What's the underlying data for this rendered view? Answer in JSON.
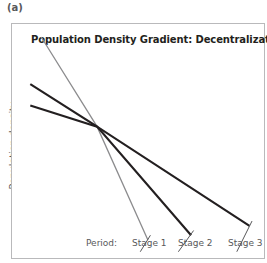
{
  "panel": {
    "letter": "(a)"
  },
  "chart_data": {
    "type": "line",
    "title": "Population Density Gradient: Decentralization",
    "xlabel": "",
    "ylabel": "Population density",
    "x_prefix_label": "Period:",
    "categories": [
      "Stage 1",
      "Stage 2",
      "Stage 3"
    ],
    "grid": false,
    "legend": "none",
    "axis_ticks": "none",
    "xlim": [
      0,
      1
    ],
    "ylim": [
      0,
      1
    ],
    "annotation": "All three density gradients pivot about a common crossover point; successive stages become progressively flatter, indicating decentralization of population away from the centre.",
    "pivot_point": {
      "x": 0.335,
      "y": 0.565
    },
    "series": [
      {
        "name": "Stage 1",
        "color": "#8c8c8e",
        "width": 1.3,
        "points": [
          [
            0.115,
            0.945
          ],
          [
            0.335,
            0.565
          ],
          [
            0.535,
            0.085
          ]
        ],
        "description": "Steepest gradient, highest central density, shortest extent"
      },
      {
        "name": "Stage 2",
        "color": "#231f20",
        "width": 2.1,
        "points": [
          [
            0.072,
            0.745
          ],
          [
            0.335,
            0.565
          ],
          [
            0.705,
            0.105
          ]
        ],
        "description": "Intermediate gradient, moderate central density"
      },
      {
        "name": "Stage 3",
        "color": "#231f20",
        "width": 2.1,
        "points": [
          [
            0.072,
            0.655
          ],
          [
            0.335,
            0.565
          ],
          [
            0.935,
            0.145
          ]
        ],
        "description": "Flattest gradient, lowest central density, longest extent"
      }
    ],
    "label_leader_lines": [
      {
        "series": "Stage 1",
        "from": [
          0.545,
          0.105
        ],
        "to": [
          0.505,
          0.035
        ]
      },
      {
        "series": "Stage 2",
        "from": [
          0.715,
          0.125
        ],
        "to": [
          0.655,
          0.035
        ]
      },
      {
        "series": "Stage 3",
        "from": [
          0.945,
          0.165
        ],
        "to": [
          0.885,
          0.035
        ]
      }
    ],
    "colors": {
      "stage_1": "#8c8c8e",
      "stage_2": "#231f20",
      "stage_3": "#231f20",
      "frame": "#b9b9bb",
      "text": "#58585a",
      "title": "#231f20"
    }
  }
}
